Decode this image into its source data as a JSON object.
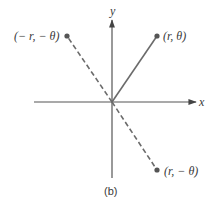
{
  "figure": {
    "caption": "(b)",
    "axes": {
      "x_label": "x",
      "y_label": "y",
      "color": "#555555"
    },
    "points": [
      {
        "label": "(r, θ)",
        "position": "first-quadrant",
        "line_style": "solid"
      },
      {
        "label": "(− r, − θ)",
        "position": "second-quadrant",
        "line_style": "dashed"
      },
      {
        "label": "(r, − θ)",
        "position": "fourth-quadrant",
        "line_style": "dashed"
      }
    ],
    "colors": {
      "solid_segment": "#6b6b6b",
      "dashed_segment": "#6b6b6b",
      "point_fill": "#555555",
      "text": "#3a3a3a"
    }
  }
}
